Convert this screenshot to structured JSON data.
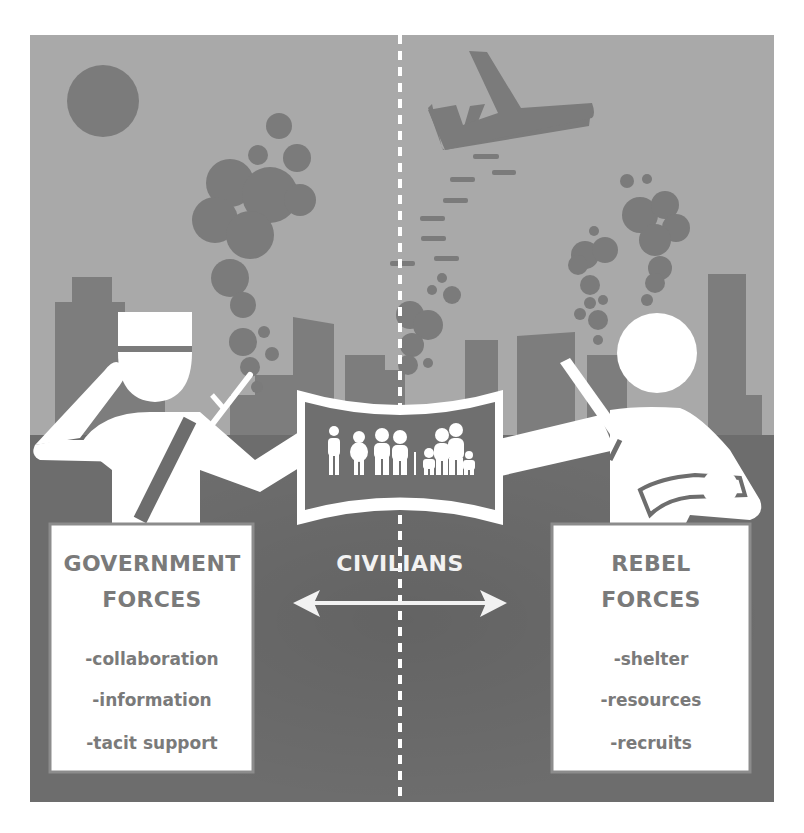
{
  "colors": {
    "sky": "#a9a9a9",
    "ground": "#6d6d6d",
    "dark_shapes": "#7b7b7b",
    "buildings": "#858585",
    "figures": "#ffffff",
    "box_text": "#7a7a7a",
    "box_border": "#8c8c8c"
  },
  "icons": {
    "sun": "sun-icon",
    "plane": "airplane-icon",
    "bombs": "bomb-icon",
    "smoke": "smoke-cloud-icon",
    "soldier": "government-soldier-icon",
    "rebel": "rebel-fighter-icon",
    "civilians": "civilian-family-icon",
    "arrow": "double-arrow-icon"
  },
  "left_box": {
    "title_line1": "GOVERNMENT",
    "title_line2": "FORCES",
    "items": [
      "-collaboration",
      "-information",
      "-tacit support"
    ]
  },
  "center": {
    "label": "CIVILIANS"
  },
  "right_box": {
    "title_line1": "REBEL",
    "title_line2": "FORCES",
    "items": [
      "-shelter",
      "-resources",
      "-recruits"
    ]
  }
}
